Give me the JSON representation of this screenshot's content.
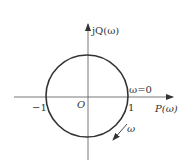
{
  "diagram": {
    "type": "nyquist-plot",
    "colors": {
      "stroke": "#333333",
      "axis": "#555555",
      "background": "#ffffff"
    },
    "axes": {
      "x_label": "P(ω)",
      "y_label": "jQ(ω)",
      "origin_label": "O"
    },
    "ticks": {
      "neg_one": "−1",
      "pos_one": "1"
    },
    "annotations": {
      "omega_zero": "ω=0",
      "omega_direction": "ω"
    },
    "circle": {
      "center": [
        0,
        0
      ],
      "radius": 1
    }
  }
}
